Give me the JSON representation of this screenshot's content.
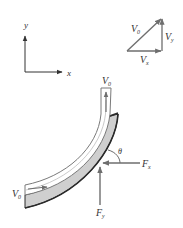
{
  "figure": {
    "colors": {
      "background": "#ffffff",
      "arrow": "#6e6e6e",
      "axis": "#333333",
      "pipe_wall_fill": "#cfcfcf",
      "pipe_wall_stroke": "#2a2a2a",
      "pipe_channel_fill": "#ffffff",
      "pipe_channel_stroke": "#7a7a7a",
      "text": "#333333"
    }
  },
  "axes": {
    "x_label": "x",
    "y_label": "y"
  },
  "velocity_triangle": {
    "hypotenuse": {
      "base": "V",
      "sub": "0"
    },
    "horizontal": {
      "base": "V",
      "sub": "x"
    },
    "vertical": {
      "base": "V",
      "sub": "y"
    }
  },
  "pipe": {
    "outlet_velocity": {
      "base": "V",
      "sub": "0"
    },
    "inlet_velocity": {
      "base": "V",
      "sub": "0"
    }
  },
  "forces": {
    "horizontal": {
      "base": "F",
      "sub": "x"
    },
    "vertical": {
      "base": "F",
      "sub": "y"
    },
    "angle": "θ"
  }
}
